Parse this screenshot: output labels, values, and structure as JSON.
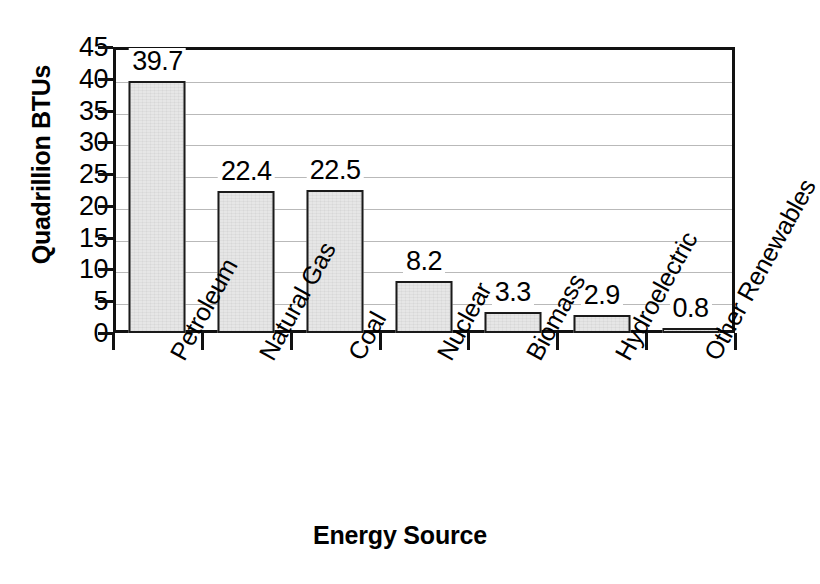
{
  "chart_data": {
    "type": "bar",
    "title": "",
    "xlabel": "Energy Source",
    "ylabel": "Quadrillion BTUs",
    "categories": [
      "Petroleum",
      "Natural Gas",
      "Coal",
      "Nuclear",
      "Biomass",
      "Hydroelectric",
      "Other Renewables"
    ],
    "values": [
      39.7,
      22.4,
      22.5,
      8.2,
      3.3,
      2.9,
      0.8
    ],
    "value_labels": [
      "39.7",
      "22.4",
      "22.5",
      "8.2",
      "3.3",
      "2.9",
      "0.8"
    ],
    "ylim": [
      0,
      45
    ],
    "ytick_step": 5,
    "ytick_labels": [
      "45",
      "40",
      "35",
      "30",
      "25",
      "20",
      "15",
      "10",
      "5",
      "0"
    ],
    "ytick_values": [
      45,
      40,
      35,
      30,
      25,
      20,
      15,
      10,
      5,
      0
    ],
    "grid": true,
    "grid_axis": "y",
    "legend": false,
    "legend_position": "none",
    "bar_fill_color": "#e6e6e6",
    "bar_edge_color": "#1a1a1a",
    "gridline_color": "#b9b9b9",
    "axis_color": "#111111",
    "background_color": "#ffffff"
  }
}
